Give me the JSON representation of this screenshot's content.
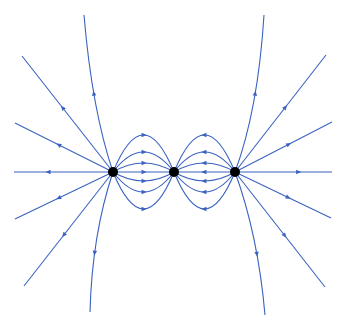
{
  "diagram": {
    "title": "Electric field lines of three point charges",
    "width": 342,
    "height": 327,
    "colors": {
      "field_line": "#3b62c0",
      "charge": "#000000",
      "background": "#ffffff"
    },
    "charges": [
      {
        "id": "left",
        "x": 113,
        "y": 172,
        "r": 5,
        "sign": "positive"
      },
      {
        "id": "center",
        "x": 174,
        "y": 172,
        "r": 5,
        "sign": "negative"
      },
      {
        "id": "right",
        "x": 235,
        "y": 172,
        "r": 5,
        "sign": "positive"
      }
    ],
    "outer_lines": [
      {
        "name": "left-up-steep",
        "from": [
          113,
          172
        ],
        "ctrl": [
          92,
          110
        ],
        "to": [
          84,
          15
        ],
        "arrow_t": 0.55,
        "dir": "out"
      },
      {
        "name": "left-up-mid",
        "from": [
          113,
          172
        ],
        "to": [
          22,
          56
        ],
        "arrow_t": 0.55,
        "dir": "out"
      },
      {
        "name": "left-up-shallow",
        "from": [
          113,
          172
        ],
        "to": [
          15,
          123
        ],
        "arrow_t": 0.55,
        "dir": "out"
      },
      {
        "name": "left-horizontal",
        "from": [
          113,
          172
        ],
        "to": [
          14,
          172
        ],
        "arrow_t": 0.65,
        "dir": "out"
      },
      {
        "name": "left-down-shallow",
        "from": [
          113,
          172
        ],
        "to": [
          15,
          219
        ],
        "arrow_t": 0.55,
        "dir": "out"
      },
      {
        "name": "left-down-mid",
        "from": [
          113,
          172
        ],
        "to": [
          24,
          286
        ],
        "arrow_t": 0.55,
        "dir": "out"
      },
      {
        "name": "left-down-steep",
        "from": [
          113,
          172
        ],
        "ctrl": [
          92,
          235
        ],
        "to": [
          90,
          312
        ],
        "arrow_t": 0.6,
        "dir": "out"
      },
      {
        "name": "right-up-steep",
        "from": [
          235,
          172
        ],
        "ctrl": [
          258,
          110
        ],
        "to": [
          264,
          15
        ],
        "arrow_t": 0.55,
        "dir": "out"
      },
      {
        "name": "right-up-mid",
        "from": [
          235,
          172
        ],
        "to": [
          326,
          55
        ],
        "arrow_t": 0.55,
        "dir": "out"
      },
      {
        "name": "right-up-shallow",
        "from": [
          235,
          172
        ],
        "to": [
          332,
          122
        ],
        "arrow_t": 0.55,
        "dir": "out"
      },
      {
        "name": "right-horizontal",
        "from": [
          235,
          172
        ],
        "to": [
          332,
          172
        ],
        "arrow_t": 0.65,
        "dir": "out"
      },
      {
        "name": "right-down-shallow",
        "from": [
          235,
          172
        ],
        "to": [
          331,
          218
        ],
        "arrow_t": 0.55,
        "dir": "out"
      },
      {
        "name": "right-down-mid",
        "from": [
          235,
          172
        ],
        "to": [
          325,
          287
        ],
        "arrow_t": 0.55,
        "dir": "out"
      },
      {
        "name": "right-down-steep",
        "from": [
          235,
          172
        ],
        "ctrl": [
          258,
          235
        ],
        "to": [
          265,
          315
        ],
        "arrow_t": 0.6,
        "dir": "out"
      }
    ],
    "inner_loops": {
      "left_pair": {
        "from": "left",
        "to": "center",
        "arrow_dir": "right",
        "peak_offsets": [
          -37,
          -20,
          -9,
          0,
          9,
          20,
          37
        ]
      },
      "right_pair": {
        "from": "right",
        "to": "center",
        "arrow_dir": "left",
        "peak_offsets": [
          -37,
          -20,
          -9,
          0,
          9,
          20,
          37
        ]
      }
    }
  }
}
